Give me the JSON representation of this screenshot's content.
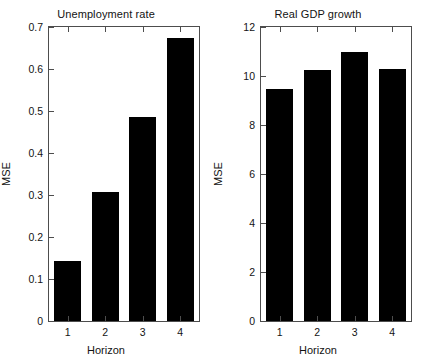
{
  "figure": {
    "background_color": "#ffffff",
    "bar_color": "#000000",
    "axis_color": "#4d4d4d"
  },
  "chart_data": [
    {
      "type": "bar",
      "title": "Unemployment rate",
      "xlabel": "Horizon",
      "ylabel": "MSE",
      "categories": [
        "1",
        "2",
        "3",
        "4"
      ],
      "values": [
        0.143,
        0.308,
        0.485,
        0.675
      ],
      "ylim": [
        0,
        0.7
      ],
      "yticks": [
        0,
        0.1,
        0.2,
        0.3,
        0.4,
        0.5,
        0.6,
        0.7
      ],
      "ytick_labels": [
        "0",
        "0.1",
        "0.2",
        "0.3",
        "0.4",
        "0.5",
        "0.6",
        "0.7"
      ],
      "grid": false,
      "legend": false,
      "bar_color": "#000000"
    },
    {
      "type": "bar",
      "title": "Real GDP growth",
      "xlabel": "Horizon",
      "ylabel": "MSE",
      "categories": [
        "1",
        "2",
        "3",
        "4"
      ],
      "values": [
        9.45,
        10.25,
        11.0,
        10.3
      ],
      "ylim": [
        0,
        12
      ],
      "yticks": [
        0,
        2,
        4,
        6,
        8,
        10,
        12
      ],
      "ytick_labels": [
        "0",
        "2",
        "4",
        "6",
        "8",
        "10",
        "12"
      ],
      "grid": false,
      "legend": false,
      "bar_color": "#000000"
    }
  ]
}
